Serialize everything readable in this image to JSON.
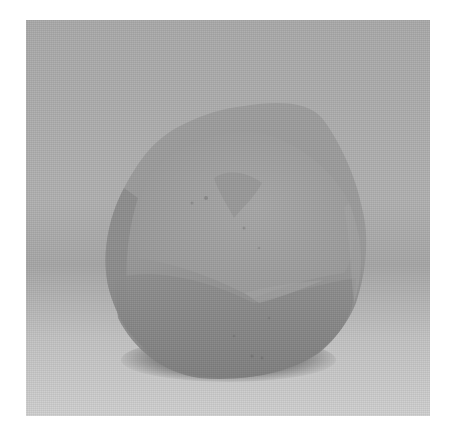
{
  "image": {
    "subject": "clay-ball",
    "description": "Grayscale photograph of a rounded, faceted lump of clay resting on a seamless gray backdrop",
    "colors": {
      "border": "#ffffff",
      "backdrop": "#acacac",
      "floor": "#cbcbcb",
      "object_upper": "#9a9a9a",
      "object_lower": "#8a8a8a",
      "object_highlight": "#a6a6a6",
      "shadow": "#3a3a3a"
    }
  }
}
